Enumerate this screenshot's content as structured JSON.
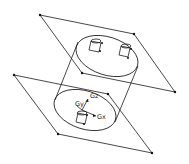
{
  "diagram": {
    "colors": {
      "line": "#1a1a1a",
      "background": "#ffffff"
    },
    "labels": {
      "gz": "Gz",
      "gy": "Gy",
      "gx": "Gx"
    }
  }
}
